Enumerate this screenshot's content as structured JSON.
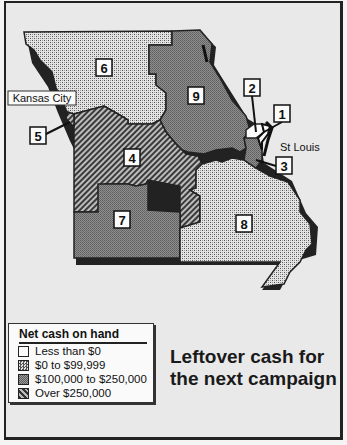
{
  "headline": [
    "Leftover cash for",
    "the next campaign"
  ],
  "legend": {
    "title": "Net cash on hand",
    "items": [
      {
        "key": "neg",
        "label": "Less than $0",
        "pattern": "white"
      },
      {
        "key": "low",
        "label": "$0 to $99,999",
        "pattern": "crosshatch"
      },
      {
        "key": "mid",
        "label": "$100,000 to $250,000",
        "pattern": "gray"
      },
      {
        "key": "high",
        "label": "Over $250,000",
        "pattern": "diagonal-hatch"
      }
    ]
  },
  "cities": {
    "kansas_city": "Kansas City",
    "st_louis": "St Louis"
  },
  "districts": [
    {
      "id": "1",
      "category": "neg"
    },
    {
      "id": "2",
      "category": "neg"
    },
    {
      "id": "3",
      "category": "mid"
    },
    {
      "id": "4",
      "category": "high"
    },
    {
      "id": "5",
      "category": "high"
    },
    {
      "id": "6",
      "category": "low"
    },
    {
      "id": "7",
      "category": "mid"
    },
    {
      "id": "8",
      "category": "low"
    },
    {
      "id": "9",
      "category": "mid"
    }
  ]
}
